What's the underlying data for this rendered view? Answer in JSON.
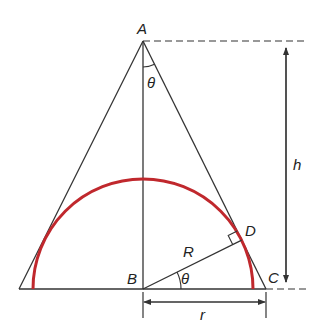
{
  "diagram": {
    "colors": {
      "line": "#333333",
      "arc": "#c0282d",
      "background": "#ffffff"
    },
    "points": {
      "A": {
        "label": "A"
      },
      "B": {
        "label": "B"
      },
      "C": {
        "label": "C"
      },
      "D": {
        "label": "D"
      }
    },
    "angles": {
      "apex": "θ",
      "base": "θ"
    },
    "lengths": {
      "radius_sphere": "R",
      "radius_base": "r",
      "height": "h"
    }
  }
}
